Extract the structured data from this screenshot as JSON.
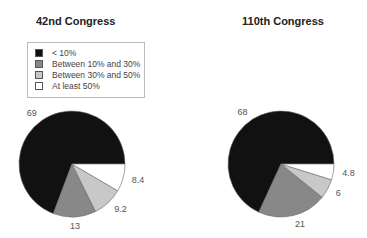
{
  "legend": {
    "items": [
      {
        "label": "< 10%",
        "color": "#111111"
      },
      {
        "label": "Between 10% and 30%",
        "color": "#888888"
      },
      {
        "label": "Between 30% and 50%",
        "color": "#c8c8c8"
      },
      {
        "label": "At least 50%",
        "color": "#ffffff"
      }
    ]
  },
  "charts": [
    {
      "title": "42nd Congress"
    },
    {
      "title": "110th Congress"
    }
  ],
  "chart_data": [
    {
      "type": "pie",
      "title": "42nd Congress",
      "categories": [
        "< 10%",
        "Between 10% and 30%",
        "Between 30% and 50%",
        "At least 50%"
      ],
      "values": [
        69,
        13,
        9.2,
        8.4
      ],
      "colors": [
        "#111111",
        "#888888",
        "#c8c8c8",
        "#ffffff"
      ],
      "legend_position": "top-left"
    },
    {
      "type": "pie",
      "title": "110th Congress",
      "categories": [
        "< 10%",
        "Between 10% and 30%",
        "Between 30% and 50%",
        "At least 50%"
      ],
      "values": [
        68,
        21,
        6,
        4.8
      ],
      "colors": [
        "#111111",
        "#888888",
        "#c8c8c8",
        "#ffffff"
      ]
    }
  ]
}
